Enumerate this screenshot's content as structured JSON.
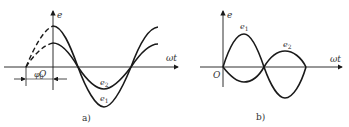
{
  "figure_a": {
    "caption": "a)",
    "y_axis_label": "e",
    "x_axis_label": "ωt",
    "origin_label": "O",
    "phase_label": "φ",
    "phase_sub": "0",
    "curve_labels": {
      "e1": "e",
      "e1_sub": "1",
      "e2": "e",
      "e2_sub": "2"
    }
  },
  "figure_b": {
    "caption": "b)",
    "y_axis_label": "e",
    "x_axis_label": "ωt",
    "origin_label": "O",
    "curve_labels": {
      "e1": "e",
      "e1_sub": "1",
      "e2": "e",
      "e2_sub": "2"
    }
  },
  "colors": {
    "stroke": "#1a1a1a",
    "text": "#333333"
  }
}
